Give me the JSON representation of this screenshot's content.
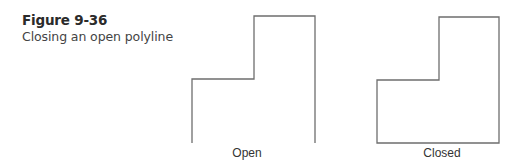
{
  "figure": {
    "title": "Figure 9-36",
    "subtitle": "Closing an open polyline"
  },
  "panels": [
    {
      "label": "Open",
      "points": "192,143 192,79 254,79 254,16 315,16 315,143",
      "closed": false
    },
    {
      "label": "Closed",
      "points": "377,143 377,80 439,80 439,17 499,17 499,143",
      "closed": true
    }
  ],
  "colors": {
    "line": "#6e6e6e",
    "text": "#2b2b2b"
  }
}
